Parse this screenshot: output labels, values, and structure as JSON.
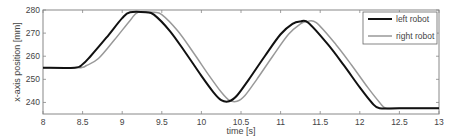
{
  "chart_data": {
    "type": "line",
    "title": "",
    "xlabel": "time [s]",
    "ylabel": "x-axis position [mm]",
    "xlim": [
      8,
      13
    ],
    "ylim": [
      235,
      280
    ],
    "xticks": [
      8,
      8.5,
      9,
      9.5,
      10,
      10.5,
      11,
      11.5,
      12,
      12.5,
      13
    ],
    "xtick_labels": [
      "8",
      "8.5",
      "9",
      "9.5",
      "10",
      "10.5",
      "11",
      "11.5",
      "12",
      "12.5",
      "13"
    ],
    "yticks": [
      240,
      250,
      260,
      270,
      280
    ],
    "ytick_labels": [
      "240",
      "250",
      "260",
      "270",
      "280"
    ],
    "grid": false,
    "legend_position": "upper right",
    "series": [
      {
        "name": "left robot",
        "color": "#111111",
        "x": [
          8,
          8.4,
          8.5,
          8.6,
          8.8,
          9.0,
          9.1,
          9.3,
          9.4,
          9.6,
          9.8,
          10.0,
          10.15,
          10.25,
          10.35,
          10.45,
          10.6,
          10.8,
          11.0,
          11.15,
          11.25,
          11.35,
          11.6,
          11.8,
          12.0,
          12.15,
          12.25,
          12.5,
          13
        ],
        "y": [
          255,
          255,
          256.5,
          260,
          268,
          276.5,
          279,
          279,
          278,
          271,
          261.5,
          251.5,
          244.5,
          241,
          240.5,
          243,
          250,
          260,
          269.5,
          274,
          275,
          274.5,
          265,
          256,
          246.5,
          240,
          237.5,
          237.5,
          237.5
        ]
      },
      {
        "name": "right robot",
        "color": "#999999",
        "x": [
          8,
          8.45,
          8.55,
          8.7,
          8.9,
          9.1,
          9.2,
          9.4,
          9.5,
          9.7,
          9.9,
          10.1,
          10.25,
          10.35,
          10.45,
          10.55,
          10.7,
          10.9,
          11.1,
          11.25,
          11.33,
          11.45,
          11.7,
          11.9,
          12.1,
          12.25,
          12.33,
          12.5,
          13
        ],
        "y": [
          255,
          255,
          256,
          259,
          267,
          275.5,
          279,
          279,
          278,
          271,
          261.5,
          251.5,
          244.5,
          241,
          240.5,
          243,
          250,
          260,
          269.5,
          274,
          275,
          274.5,
          265,
          256,
          246.5,
          240,
          237.5,
          237.5,
          237.5
        ]
      }
    ]
  }
}
